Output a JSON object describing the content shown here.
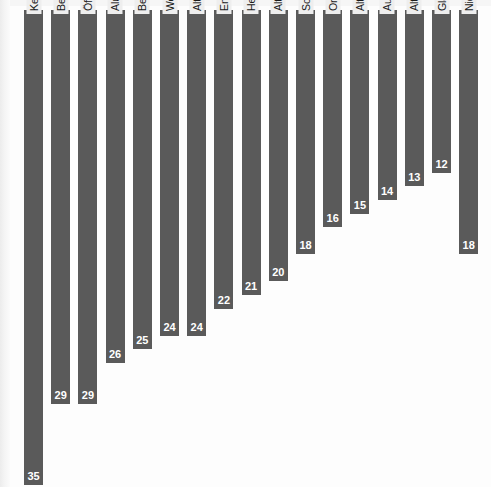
{
  "chart_data": {
    "type": "bar",
    "title": "",
    "xlabel": "",
    "ylabel": "",
    "ylim": [
      0,
      35
    ],
    "grid": false,
    "legend": "none",
    "orientation": "vertical",
    "value_label_position": "inside-bottom",
    "category_label_rotation": -90,
    "categories": [
      "Keine Wegwerfflaschen oder Getränkedosen kaufen",
      "Beim Einkauf auf Artikel mit umweltfreundlicher Verpackung achten",
      "Öffentliche Verkehrsmittel dem Auto vorziehen",
      "Aluminium getrennt vom Hausmüll sammeln",
      "Beim Einkauf keine Plastiktüten verwenden",
      "Weniger Strom verbrauchen",
      "Alte Arzneimittel in der Apotheke abgeben",
      "Energiesparende Haushaltsgeräte anschaffen",
      "Heizwärme sparen, die Wohnung besser isolieren",
      "Alte Batterien bei den Sammelstellen abgeben",
      "Sonderabfälle (z. B. Altöl) zur Deponie bringen",
      "Organische Abfälle kompostieren",
      "Alte Kleider in die Sammlung geben",
      "Auto mit Katalysator fahren",
      "Altpapier in die Sammlung geben",
      "Glas zum Container bringen",
      "Nichts davon"
    ],
    "values": [
      35,
      29,
      29,
      26,
      25,
      24,
      24,
      22,
      21,
      20,
      18,
      16,
      15,
      14,
      13,
      12,
      18
    ]
  },
  "style": {
    "bar_color": "#5a5a5a",
    "label_background": "#eeeeee",
    "value_text_color": "#ffffff",
    "background": "#fdfdfd"
  }
}
